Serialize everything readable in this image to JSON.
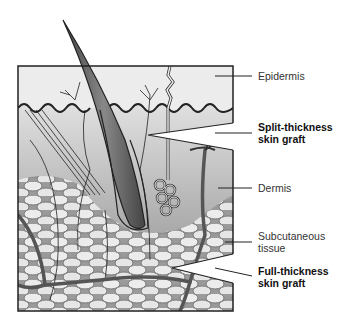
{
  "figure": {
    "labels": [
      {
        "id": "epidermis",
        "lines": [
          "Epidermis"
        ],
        "bold": false
      },
      {
        "id": "split-thickness",
        "lines": [
          "Split-thickness",
          "skin graft"
        ],
        "bold": true
      },
      {
        "id": "dermis",
        "lines": [
          "Dermis"
        ],
        "bold": false
      },
      {
        "id": "subcutaneous",
        "lines": [
          "Subcutaneous",
          "tissue"
        ],
        "bold": false
      },
      {
        "id": "full-thickness",
        "lines": [
          "Full-thickness",
          "skin graft"
        ],
        "bold": true
      }
    ],
    "colors": {
      "epidermis": "#e8e8e8",
      "dermis_top": "#d6d6d6",
      "dermis_bottom": "#8c8c8c",
      "fat_cell": "#ececec",
      "fat_outline": "#8a8a8a",
      "vessel": "#555555",
      "outline": "#222222"
    }
  }
}
